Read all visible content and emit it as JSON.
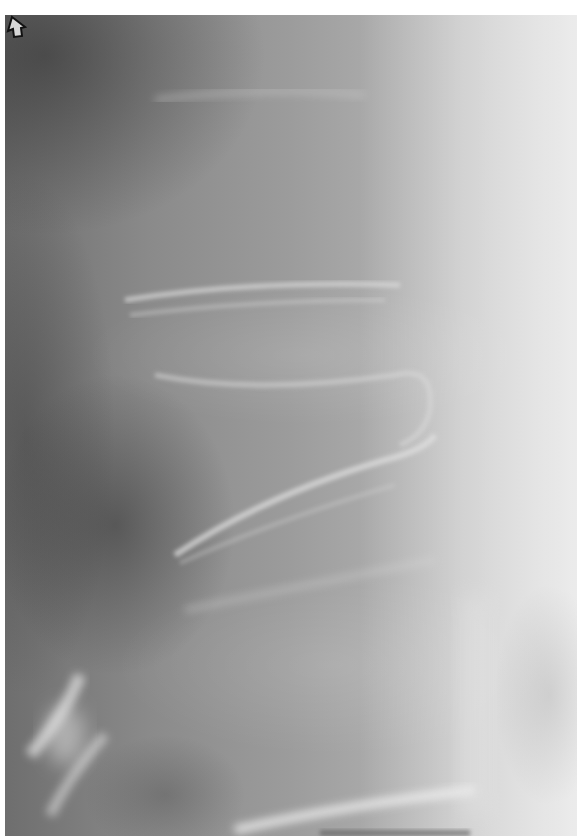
{
  "image": {
    "kind": "radiograph",
    "description": "Lateral lumbar spine X-ray with arrow annotation",
    "annotation": {
      "type": "arrow",
      "direction": "up-left",
      "icon": "outline-arrow-icon",
      "color": "#111111",
      "position": {
        "x": 277,
        "y": 430
      }
    },
    "palette": {
      "dark": "#5a5a5a",
      "mid": "#9c9c9c",
      "light": "#d8d8d8",
      "border": "#ffffff"
    }
  }
}
